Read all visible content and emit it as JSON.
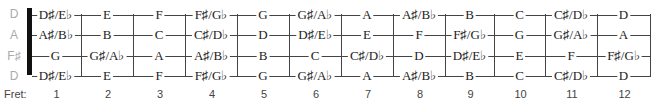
{
  "open_strings": [
    "D",
    "A",
    "F♯",
    "D"
  ],
  "fret_word": "Fret:",
  "fret_numbers": [
    "1",
    "2",
    "3",
    "4",
    "5",
    "6",
    "7",
    "8",
    "9",
    "10",
    "11",
    "12"
  ],
  "strings": [
    [
      "D♯/E♭",
      "E",
      "F",
      "F♯/G♭",
      "G",
      "G♯/A♭",
      "A",
      "A♯/B♭",
      "B",
      "C",
      "C♯/D♭",
      "D"
    ],
    [
      "A♯/B♭",
      "B",
      "C",
      "C♯/D♭",
      "D",
      "D♯/E♭",
      "E",
      "F",
      "F♯/G♭",
      "G",
      "G♯/A♭",
      "A"
    ],
    [
      "G",
      "G♯/A♭",
      "A",
      "A♯/B♭",
      "B",
      "C",
      "C♯/D♭",
      "D",
      "D♯/E♭",
      "E",
      "F",
      "F♯/G♭"
    ],
    [
      "D♯/E♭",
      "E",
      "F",
      "F♯/G♭",
      "G",
      "G♯/A♭",
      "A",
      "A♯/B♭",
      "B",
      "C",
      "C♯/D♭",
      "D"
    ]
  ],
  "colors": {
    "line": "#444444",
    "open_label": "#aaaaaa",
    "nut": "#111111"
  }
}
